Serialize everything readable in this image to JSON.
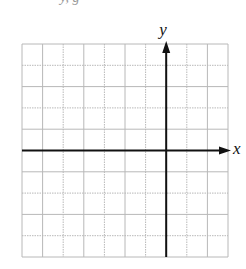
{
  "header": {
    "partial_text": "y, g"
  },
  "diagram": {
    "type": "coordinate-grid",
    "grid": {
      "columns": 10,
      "rows": 10,
      "left": 22,
      "top": 44,
      "right": 228,
      "bottom": 257,
      "line_color": "#b8b8b8",
      "axis_color": "#111111"
    },
    "axes": {
      "x_label": "x",
      "y_label": "y",
      "x_axis_row_from_top": 5,
      "y_axis_col_from_left": 7
    }
  }
}
